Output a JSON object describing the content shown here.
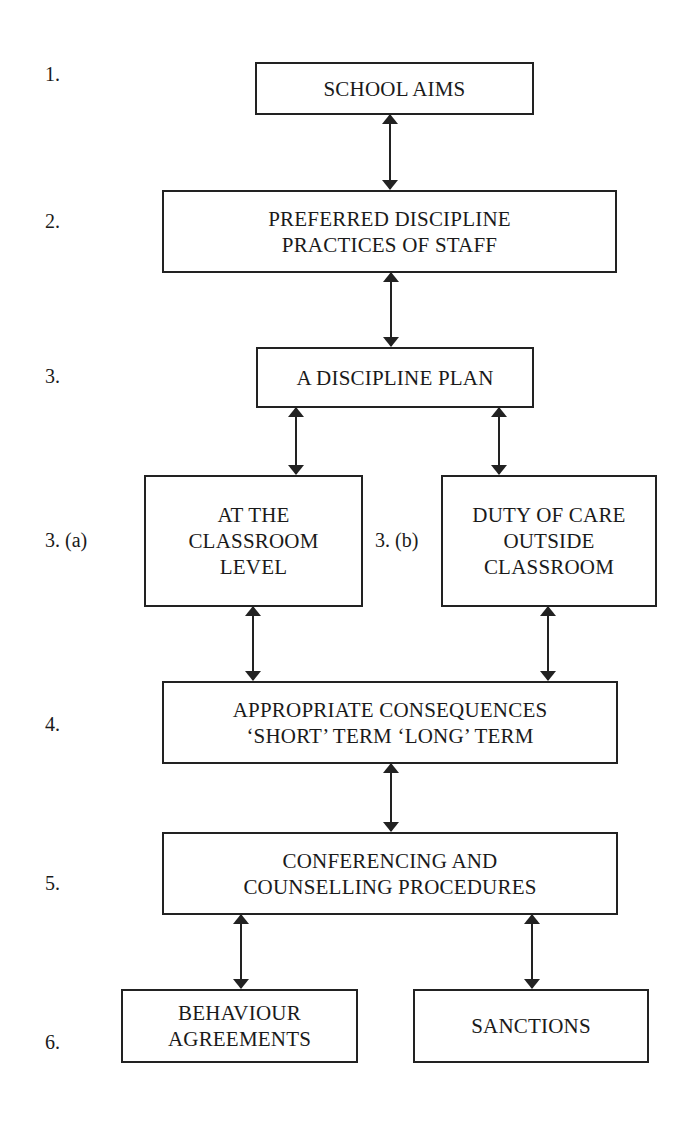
{
  "diagram": {
    "type": "flowchart",
    "step_labels": {
      "s1": "1.",
      "s2": "2.",
      "s3": "3.",
      "s3a": "3. (a)",
      "s3b": "3. (b)",
      "s4": "4.",
      "s5": "5.",
      "s6": "6."
    },
    "nodes": {
      "school_aims": {
        "lines": [
          "SCHOOL AIMS"
        ]
      },
      "preferred_practices": {
        "lines": [
          "PREFERRED DISCIPLINE",
          "PRACTICES OF STAFF"
        ]
      },
      "discipline_plan": {
        "lines": [
          "A DISCIPLINE PLAN"
        ]
      },
      "classroom_level": {
        "lines": [
          "AT THE",
          "CLASSROOM",
          "LEVEL"
        ]
      },
      "duty_of_care": {
        "lines": [
          "DUTY OF CARE",
          "OUTSIDE",
          "CLASSROOM"
        ]
      },
      "consequences": {
        "lines": [
          "APPROPRIATE CONSEQUENCES",
          "‘SHORT’ TERM ‘LONG’ TERM"
        ]
      },
      "conferencing": {
        "lines": [
          "CONFERENCING AND",
          "COUNSELLING PROCEDURES"
        ]
      },
      "behaviour_agreements": {
        "lines": [
          "BEHAVIOUR",
          "AGREEMENTS"
        ]
      },
      "sanctions": {
        "lines": [
          "SANCTIONS"
        ]
      }
    },
    "edges": [
      {
        "from": "school_aims",
        "to": "preferred_practices",
        "style": "bidirectional"
      },
      {
        "from": "preferred_practices",
        "to": "discipline_plan",
        "style": "bidirectional"
      },
      {
        "from": "discipline_plan",
        "to": "classroom_level",
        "style": "bidirectional"
      },
      {
        "from": "discipline_plan",
        "to": "duty_of_care",
        "style": "bidirectional"
      },
      {
        "from": "classroom_level",
        "to": "consequences",
        "style": "bidirectional"
      },
      {
        "from": "duty_of_care",
        "to": "consequences",
        "style": "bidirectional"
      },
      {
        "from": "consequences",
        "to": "conferencing",
        "style": "bidirectional"
      },
      {
        "from": "conferencing",
        "to": "behaviour_agreements",
        "style": "bidirectional"
      },
      {
        "from": "conferencing",
        "to": "sanctions",
        "style": "bidirectional"
      }
    ],
    "colors": {
      "line": "#222222",
      "background": "#ffffff",
      "text": "#1a1a1a"
    }
  }
}
